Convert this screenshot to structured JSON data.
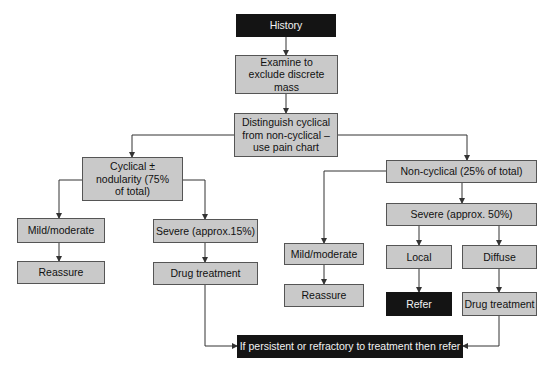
{
  "nodes": {
    "history": "History",
    "examine": "Examine to exclude discrete mass",
    "distinguish": "Distinguish cyclical from non-cyclical – use pain chart",
    "cyclical": "Cyclical ± nodularity (75% of total)",
    "cyc_mild": "Mild/moderate",
    "cyc_severe": "Severe (approx.15%)",
    "cyc_reassure": "Reassure",
    "cyc_drug": "Drug treatment",
    "noncyclical": "Non-cyclical (25% of total)",
    "non_mild": "Mild/moderate",
    "non_reassure": "Reassure",
    "non_severe": "Severe (approx. 50%)",
    "local": "Local",
    "diffuse": "Diffuse",
    "refer": "Refer",
    "non_drug": "Drug treatment",
    "final": "If persistent or refractory to treatment then refer"
  },
  "colors": {
    "box_fill": "#c9c9c9",
    "dark_fill": "#141414",
    "line": "#333333"
  }
}
